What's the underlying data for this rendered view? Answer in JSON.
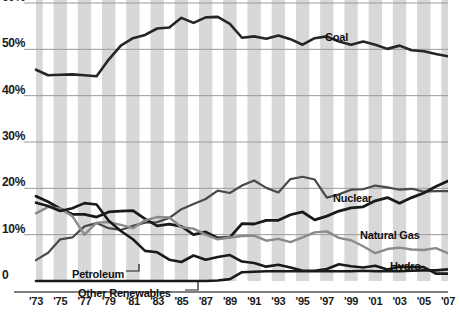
{
  "chart_data": {
    "type": "line",
    "title": "",
    "xlabel": "",
    "ylabel": "",
    "grid": true,
    "legend_position": "inline-annotations",
    "ylim": [
      0,
      60
    ],
    "xlim": [
      1973,
      2007
    ],
    "y_ticks": [
      "0",
      "10%",
      "20%",
      "30%",
      "40%",
      "50%",
      "60%"
    ],
    "y_tick_values": [
      0,
      10,
      20,
      30,
      40,
      50,
      60
    ],
    "x_ticks": [
      "'73",
      "'75",
      "'77",
      "'79",
      "'81",
      "'83",
      "'85",
      "'87",
      "'89",
      "'91",
      "'93",
      "'95",
      "'97",
      "'99",
      "'01",
      "'03",
      "'05",
      "'07"
    ],
    "x_tick_values": [
      1973,
      1975,
      1977,
      1979,
      1981,
      1983,
      1985,
      1987,
      1989,
      1991,
      1993,
      1995,
      1997,
      1999,
      2001,
      2003,
      2005,
      2007
    ],
    "x": [
      1973,
      1974,
      1975,
      1976,
      1977,
      1978,
      1979,
      1980,
      1981,
      1982,
      1983,
      1984,
      1985,
      1986,
      1987,
      1988,
      1989,
      1990,
      1991,
      1992,
      1993,
      1994,
      1995,
      1996,
      1997,
      1998,
      1999,
      2000,
      2001,
      2002,
      2003,
      2004,
      2005,
      2006,
      2007
    ],
    "series": [
      {
        "name": "Coal",
        "color": "#262626",
        "width": 2.6,
        "label_x": 325,
        "label_y": 31,
        "values": [
          45.6,
          44.4,
          44.5,
          44.6,
          44.4,
          44.2,
          47.8,
          50.8,
          52.4,
          53.1,
          54.5,
          54.7,
          56.8,
          55.7,
          56.9,
          57.0,
          55.5,
          52.5,
          52.8,
          52.3,
          53.0,
          52.2,
          51.0,
          52.4,
          52.8,
          51.7,
          51.0,
          51.7,
          51.0,
          50.1,
          50.8,
          49.8,
          49.6,
          49.0,
          48.5
        ]
      },
      {
        "name": "Nuclear",
        "color": "#4a4a4a",
        "width": 2.2,
        "label_x": 333,
        "label_y": 192,
        "values": [
          4.5,
          6.1,
          9.0,
          9.4,
          11.8,
          12.5,
          11.4,
          11.0,
          11.9,
          12.6,
          12.7,
          13.6,
          15.5,
          16.6,
          17.7,
          19.5,
          19.0,
          20.6,
          21.7,
          20.1,
          19.1,
          22.0,
          22.5,
          21.9,
          18.0,
          18.7,
          19.7,
          19.8,
          20.6,
          20.2,
          19.7,
          19.9,
          19.3,
          19.4,
          19.4
        ]
      },
      {
        "name": "Natural Gas",
        "color": "#1a1a1a",
        "width": 2.8,
        "label_x": 360,
        "label_y": 229,
        "values": [
          18.3,
          17.1,
          15.6,
          14.4,
          14.4,
          13.8,
          14.9,
          15.1,
          15.2,
          13.4,
          11.9,
          12.3,
          11.8,
          10.0,
          10.6,
          9.3,
          9.4,
          12.4,
          12.3,
          13.1,
          13.1,
          14.3,
          14.9,
          13.2,
          14.0,
          15.1,
          15.8,
          16.0,
          17.3,
          18.0,
          16.8,
          18.0,
          19.0,
          20.4,
          21.6
        ]
      },
      {
        "name": "Hydro",
        "color": "#8a8a8a",
        "width": 2.4,
        "label_x": 390,
        "label_y": 260,
        "values": [
          14.6,
          16.0,
          15.6,
          14.0,
          10.0,
          12.6,
          12.7,
          12.1,
          11.4,
          13.1,
          13.8,
          13.7,
          11.6,
          11.3,
          10.0,
          9.0,
          9.4,
          9.7,
          9.8,
          8.7,
          9.1,
          8.4,
          9.4,
          10.5,
          10.7,
          9.3,
          8.8,
          7.5,
          6.0,
          6.9,
          7.2,
          6.8,
          6.7,
          7.1,
          6.0
        ]
      },
      {
        "name": "Petroleum",
        "color": "#1a1a1a",
        "width": 2.6,
        "label_x": 72,
        "label_y": 268,
        "leader": [
          [
            126,
            271
          ],
          [
            139,
            271
          ],
          [
            139,
            264
          ]
        ],
        "values": [
          16.9,
          16.2,
          15.1,
          15.7,
          16.8,
          16.5,
          13.0,
          10.8,
          9.0,
          6.5,
          6.2,
          4.6,
          4.1,
          5.5,
          4.6,
          5.2,
          5.6,
          4.2,
          3.9,
          3.1,
          3.5,
          2.9,
          2.2,
          2.2,
          2.6,
          3.6,
          3.2,
          2.9,
          3.3,
          2.5,
          3.1,
          3.0,
          3.0,
          1.6,
          1.6
        ]
      },
      {
        "name": "Other Renewables",
        "color": "#1a1a1a",
        "width": 2.6,
        "label_x": 78,
        "label_y": 287,
        "leader": [
          [
            185,
            290
          ],
          [
            198,
            290
          ],
          [
            198,
            281
          ]
        ],
        "values": [
          0.0,
          0.0,
          0.0,
          0.0,
          0.0,
          0.0,
          0.0,
          0.0,
          0.0,
          0.0,
          0.0,
          0.0,
          0.0,
          0.0,
          0.0,
          0.1,
          0.4,
          1.9,
          2.0,
          2.1,
          2.1,
          2.1,
          2.1,
          2.1,
          2.1,
          2.1,
          2.1,
          2.2,
          2.1,
          2.1,
          2.1,
          2.2,
          2.3,
          2.3,
          2.5
        ]
      }
    ],
    "band_color": "#d8d8d8",
    "gridline_color": "#9a9a9a",
    "axis_color": "#555555"
  }
}
